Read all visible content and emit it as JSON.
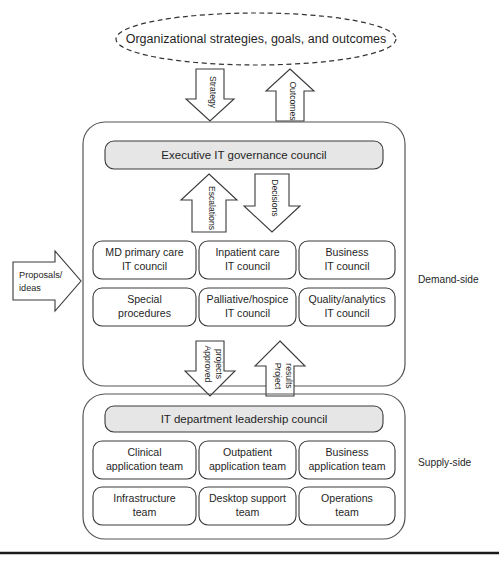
{
  "diagram": {
    "title_ellipse": {
      "label": "Organizational strategies, goals, and outcomes"
    },
    "flow_arrows_top": [
      {
        "name": "strategy-arrow",
        "label": "Strategy",
        "direction": "down"
      },
      {
        "name": "outcomes-arrow",
        "label": "Outcomes",
        "direction": "up"
      }
    ],
    "demand_side": {
      "side_label": "Demand-side",
      "header_box": {
        "label": "Executive IT governance council",
        "fill": "#e6e6e6"
      },
      "mid_arrows": [
        {
          "name": "escalations-arrow",
          "label": "Escalations",
          "direction": "up"
        },
        {
          "name": "decisions-arrow",
          "label": "Decisions",
          "direction": "down"
        }
      ],
      "input_arrow": {
        "label_line1": "Proposals/",
        "label_line2": "ideas",
        "direction": "right"
      },
      "councils": [
        {
          "line1": "MD primary care",
          "line2": "IT council"
        },
        {
          "line1": "Inpatient care",
          "line2": "IT council"
        },
        {
          "line1": "Business",
          "line2": "IT council"
        },
        {
          "line1": "Special",
          "line2": "procedures"
        },
        {
          "line1": "Palliative/hospice",
          "line2": "IT council"
        },
        {
          "line1": "Quality/analytics",
          "line2": "IT council"
        }
      ]
    },
    "between_arrows": [
      {
        "name": "approved-projects-arrow",
        "label_line1": "Approved",
        "label_line2": "projects",
        "direction": "down"
      },
      {
        "name": "project-results-arrow",
        "label_line1": "Project",
        "label_line2": "results",
        "direction": "up"
      }
    ],
    "supply_side": {
      "side_label": "Supply-side",
      "header_box": {
        "label": "IT department leadership council",
        "fill": "#e6e6e6"
      },
      "teams": [
        {
          "line1": "Clinical",
          "line2": "application team"
        },
        {
          "line1": "Outpatient",
          "line2": "application team"
        },
        {
          "line1": "Business",
          "line2": "application team"
        },
        {
          "line1": "Infrastructure",
          "line2": "team"
        },
        {
          "line1": "Desktop support",
          "line2": "team"
        },
        {
          "line1": "Operations",
          "line2": "team"
        }
      ]
    },
    "footer_rule": {
      "visible": true
    }
  }
}
